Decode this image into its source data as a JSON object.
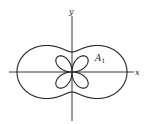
{
  "figure": {
    "axes": {
      "x_label": "x",
      "y_label": "y"
    },
    "region_label": {
      "main": "A",
      "subscript": "1"
    },
    "curves": [
      {
        "name": "outer-peanut-curve",
        "form": "r = a + b cos(2θ)",
        "a": 37.5,
        "b": 17.5
      },
      {
        "name": "inner-four-petal-rose",
        "form": "r = c sin(2θ)",
        "c": 21
      }
    ],
    "colors": {
      "stroke": "#222222",
      "background": "#ffffff"
    }
  }
}
